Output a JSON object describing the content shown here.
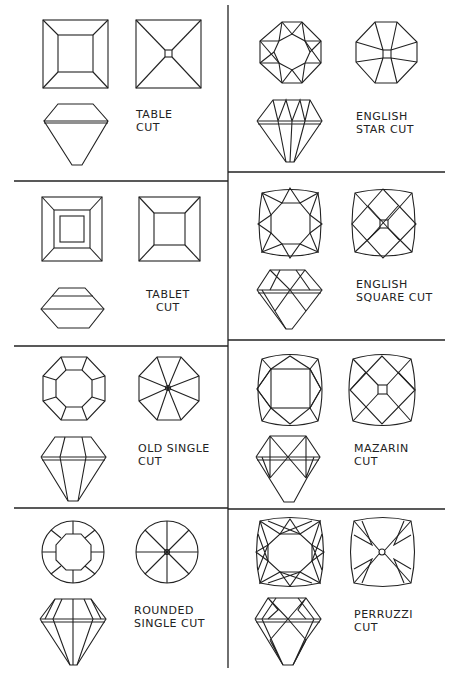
{
  "cuts": [
    {
      "id": "table",
      "label_lines": [
        "TABLE",
        "CUT"
      ]
    },
    {
      "id": "english-star",
      "label_lines": [
        "ENGLISH",
        "STAR CUT"
      ]
    },
    {
      "id": "tablet",
      "label_lines": [
        "TABLET",
        "CUT"
      ]
    },
    {
      "id": "english-square",
      "label_lines": [
        "ENGLISH",
        "SQUARE CUT"
      ]
    },
    {
      "id": "old-single",
      "label_lines": [
        "OLD SINGLE",
        "CUT"
      ]
    },
    {
      "id": "mazarin",
      "label_lines": [
        "MAZARIN",
        "CUT"
      ]
    },
    {
      "id": "rounded-single",
      "label_lines": [
        "ROUNDED",
        "SINGLE CUT"
      ]
    },
    {
      "id": "perruzzi",
      "label_lines": [
        "PERRUZZI",
        "CUT"
      ]
    }
  ]
}
